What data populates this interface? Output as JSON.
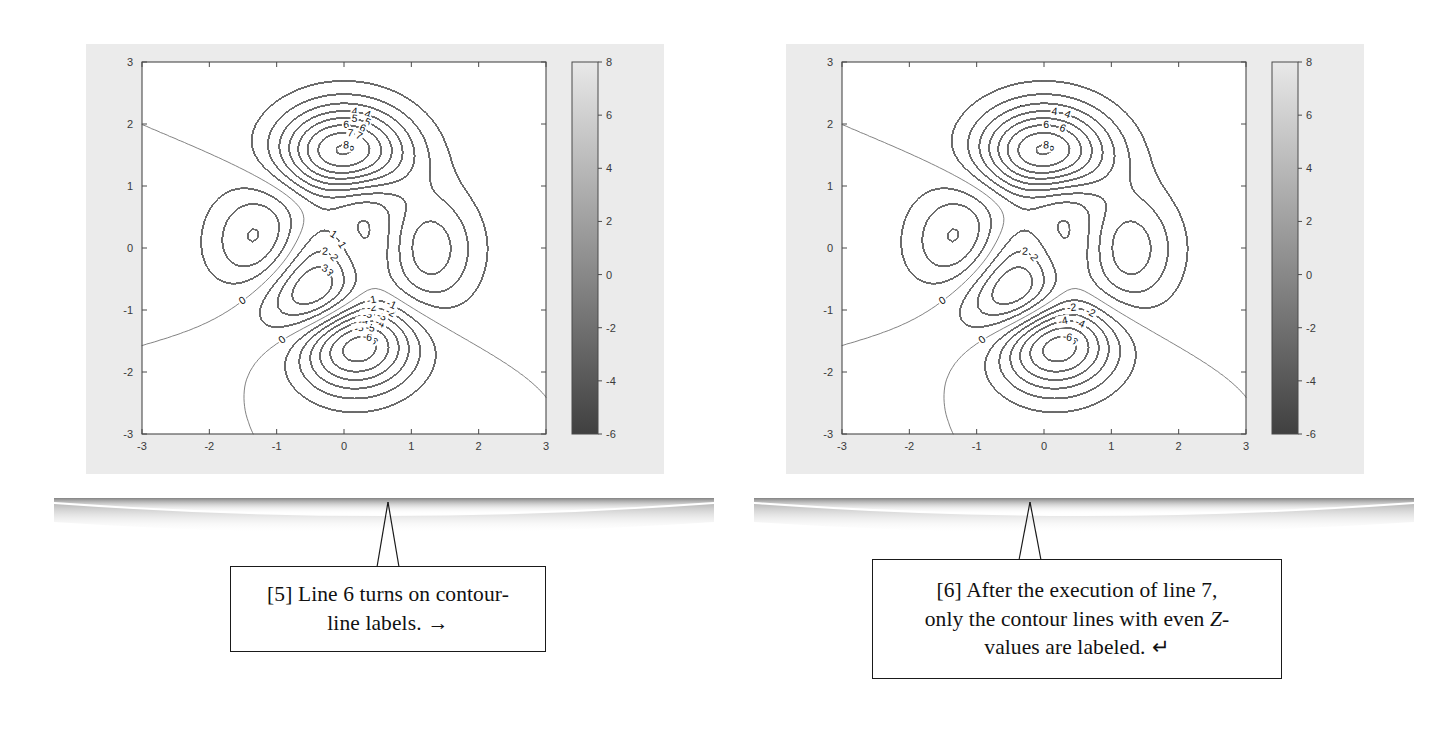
{
  "page": {
    "width": 1451,
    "height": 751,
    "background": "#ffffff"
  },
  "figures": [
    {
      "id": "figure-left",
      "name": "contour-plot-all-labels",
      "frame": {
        "x": 66,
        "y": 22,
        "width": 620,
        "height": 480
      },
      "inner": {
        "x": 20,
        "y": 22,
        "width": 578,
        "height": 430
      },
      "background": "#ebebeb",
      "axes_background": "#ffffff",
      "line_color": "#6b6b6b",
      "axis_color": "#4a4a4a",
      "label_color": "#3a3a3a"
    },
    {
      "id": "figure-right",
      "name": "contour-plot-even-labels",
      "frame": {
        "x": 766,
        "y": 22,
        "width": 620,
        "height": 480
      },
      "inner": {
        "x": 20,
        "y": 22,
        "width": 578,
        "height": 430
      },
      "background": "#ebebeb",
      "axes_background": "#ffffff",
      "line_color": "#6b6b6b",
      "axis_color": "#4a4a4a",
      "label_color": "#3a3a3a"
    }
  ],
  "chart_data": [
    {
      "type": "contour",
      "id": "left-contour",
      "title": "",
      "xlabel": "",
      "ylabel": "",
      "xlim": [
        -3,
        3
      ],
      "ylim": [
        -3,
        3
      ],
      "xticks": [
        -3,
        -2,
        -1,
        0,
        1,
        2,
        3
      ],
      "yticks": [
        -3,
        -2,
        -1,
        0,
        1,
        2,
        3
      ],
      "xticklabels": [
        "-3",
        "-2",
        "-1",
        "0",
        "1",
        "2",
        "3"
      ],
      "yticklabels": [
        "-3",
        "-2",
        "-1",
        "0",
        "1",
        "2",
        "3"
      ],
      "grid": false,
      "function": "peaks",
      "contour_levels": [
        -6,
        -5,
        -4,
        -3,
        -2,
        -1,
        0,
        1,
        2,
        3,
        4,
        5,
        6,
        7,
        8
      ],
      "labeled_levels": [
        -6,
        -5,
        -4,
        -3,
        -2,
        -1,
        0,
        1,
        2,
        3,
        4,
        5,
        6,
        7,
        8
      ],
      "labeling": "all contour lines labeled (clabel on every level)",
      "colorbar": {
        "present": true,
        "orientation": "vertical",
        "position": "right",
        "min": -6,
        "max": 8,
        "ticks": [
          -6,
          -4,
          -2,
          0,
          2,
          4,
          6,
          8
        ],
        "ticklabels": [
          "-6",
          "-4",
          "-2",
          "0",
          "2",
          "4",
          "6",
          "8"
        ],
        "colormap": "gray",
        "low_color": "#404040",
        "high_color": "#e8e8e8"
      }
    },
    {
      "type": "contour",
      "id": "right-contour",
      "title": "",
      "xlabel": "",
      "ylabel": "",
      "xlim": [
        -3,
        3
      ],
      "ylim": [
        -3,
        3
      ],
      "xticks": [
        -3,
        -2,
        -1,
        0,
        1,
        2,
        3
      ],
      "yticks": [
        -3,
        -2,
        -1,
        0,
        1,
        2,
        3
      ],
      "xticklabels": [
        "-3",
        "-2",
        "-1",
        "0",
        "1",
        "2",
        "3"
      ],
      "yticklabels": [
        "-3",
        "-2",
        "-1",
        "0",
        "1",
        "2",
        "3"
      ],
      "grid": false,
      "function": "peaks",
      "contour_levels": [
        -6,
        -5,
        -4,
        -3,
        -2,
        -1,
        0,
        1,
        2,
        3,
        4,
        5,
        6,
        7,
        8
      ],
      "labeled_levels": [
        -6,
        -4,
        -2,
        0,
        2,
        4,
        6,
        8
      ],
      "labeling": "only even Z-value contour lines labeled",
      "colorbar": {
        "present": true,
        "orientation": "vertical",
        "position": "right",
        "min": -6,
        "max": 8,
        "ticks": [
          -6,
          -4,
          -2,
          0,
          2,
          4,
          6,
          8
        ],
        "ticklabels": [
          "-6",
          "-4",
          "-2",
          "0",
          "2",
          "4",
          "6",
          "8"
        ],
        "colormap": "gray",
        "low_color": "#404040",
        "high_color": "#e8e8e8"
      }
    }
  ],
  "callouts": [
    {
      "id": "callout-5",
      "name": "callout-line6-labels",
      "box": {
        "x": 230,
        "y": 566,
        "width": 316,
        "height": 86
      },
      "leader": {
        "from_x": 388,
        "to_x": 388,
        "from_y": 502,
        "to_y": 566
      },
      "line1": "[5] Line 6 turns on contour-",
      "line2": "line labels.",
      "arrow_glyph": "→",
      "arrow_name": "right-arrow"
    },
    {
      "id": "callout-6",
      "name": "callout-line7-even-labels",
      "box": {
        "x": 872,
        "y": 559,
        "width": 410,
        "height": 120
      },
      "leader": {
        "from_x": 1030,
        "to_x": 1030,
        "from_y": 502,
        "to_y": 559
      },
      "line1": "[6] After the execution of line 7,",
      "line2_a": "only the contour lines with even ",
      "line2_italic": "Z",
      "line2_b": "-",
      "line3": "values are labeled.",
      "arrow_glyph": "↵",
      "arrow_name": "return-arrow"
    }
  ],
  "colors": {
    "page_background": "#ffffff",
    "figure_background": "#ebebeb",
    "axes_background": "#ffffff",
    "contour_line": "#6b6b6b",
    "axis_line": "#4a4a4a",
    "text": "#111111",
    "shadow": "#9a9a9a"
  }
}
